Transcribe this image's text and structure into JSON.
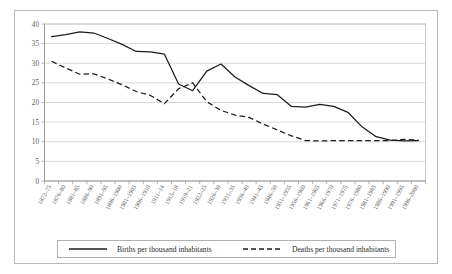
{
  "chart_data": {
    "type": "line",
    "title": "",
    "xlabel": "",
    "ylabel": "",
    "ylim": [
      0,
      40
    ],
    "yticks": [
      0,
      5,
      10,
      15,
      20,
      25,
      30,
      35,
      40
    ],
    "grid": true,
    "legend_position": "bottom",
    "categories": [
      "1872–75",
      "1876–80",
      "1881–85",
      "1886–90",
      "1891–95",
      "1896–1900",
      "1901–1905",
      "1906–1910",
      "1911–14",
      "1915–18",
      "1919–21",
      "1922–25",
      "1926–30",
      "1931–35",
      "1936–40",
      "1941–45",
      "1946–50",
      "1951–1955",
      "1956–1960",
      "1961–1965",
      "1966–1970",
      "1971–1975",
      "1976–1980",
      "1981–1985",
      "1986–1990",
      "1991–1995",
      "1996–2000"
    ],
    "series": [
      {
        "name": "Births per thousand inhabitants",
        "style": "solid",
        "color": "#1c1c1c",
        "values": [
          36.8,
          37.3,
          38.0,
          37.7,
          36.3,
          34.8,
          33.0,
          32.9,
          32.3,
          24.7,
          23.0,
          28.0,
          29.8,
          26.5,
          24.3,
          22.3,
          22.0,
          19.0,
          18.8,
          19.5,
          19.0,
          17.5,
          13.8,
          11.3,
          10.4,
          10.2,
          10.3
        ]
      },
      {
        "name": "Deaths per thousand inhabitants",
        "style": "dashed",
        "color": "#1c1c1c",
        "values": [
          30.5,
          28.8,
          27.2,
          27.3,
          26.0,
          24.5,
          22.8,
          21.8,
          19.7,
          23.5,
          25.0,
          20.2,
          18.0,
          16.8,
          16.2,
          14.5,
          13.0,
          11.5,
          10.3,
          10.2,
          10.3,
          10.3,
          10.3,
          10.3,
          10.3,
          10.6,
          10.4
        ]
      }
    ]
  },
  "legend": {
    "items": [
      {
        "label": "Births per thousand inhabitants",
        "style": "solid"
      },
      {
        "label": "Deaths per thousand inhabitants",
        "style": "dashed"
      }
    ]
  }
}
